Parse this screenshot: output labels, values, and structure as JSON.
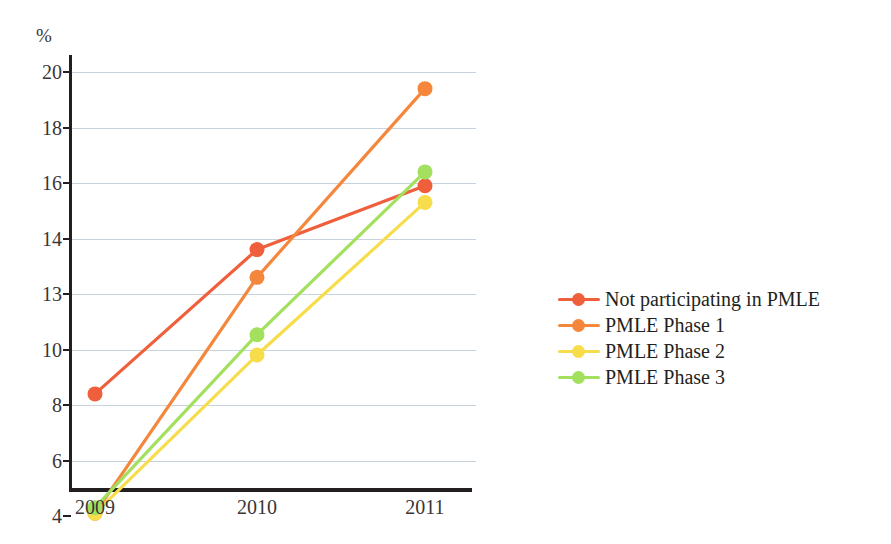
{
  "chart_data": {
    "type": "line",
    "title": "",
    "subtitle": "",
    "xlabel": "",
    "ylabel": "%",
    "unit_label": "%",
    "categories": [
      "2009",
      "2010",
      "2011"
    ],
    "x": [
      2009,
      2010,
      2011
    ],
    "ytick_labels": [
      "20",
      "18",
      "16",
      "14",
      "13",
      "10",
      "8",
      "6",
      "4"
    ],
    "ytick_values": [
      20,
      18,
      16,
      14,
      13,
      10,
      8,
      6,
      4
    ],
    "ylim": [
      4,
      20
    ],
    "grid": "horizontal",
    "legend_position": "right",
    "series": [
      {
        "name": "Not participating in PMLE",
        "color": "#ef5f3c",
        "values": [
          8.4,
          13.8,
          15.9
        ]
      },
      {
        "name": "PMLE Phase 1",
        "color": "#f5873c",
        "values": [
          4.1,
          13.3,
          19.4
        ]
      },
      {
        "name": "PMLE Phase 2",
        "color": "#f7dd4c",
        "values": [
          4.1,
          9.8,
          15.3
        ]
      },
      {
        "name": "PMLE Phase 3",
        "color": "#a3e05e",
        "values": [
          4.3,
          10.8,
          16.4
        ]
      }
    ],
    "colors": {
      "axis": "#231f20",
      "grid": "#c9d3dd",
      "text": "#3a3536",
      "background": "#ffffff"
    }
  },
  "legend": {
    "items": [
      {
        "label": "Not participating in PMLE",
        "color": "#ef5f3c"
      },
      {
        "label": "PMLE Phase 1",
        "color": "#f5873c"
      },
      {
        "label": "PMLE Phase 2",
        "color": "#f7dd4c"
      },
      {
        "label": "PMLE Phase 3",
        "color": "#a3e05e"
      }
    ]
  }
}
